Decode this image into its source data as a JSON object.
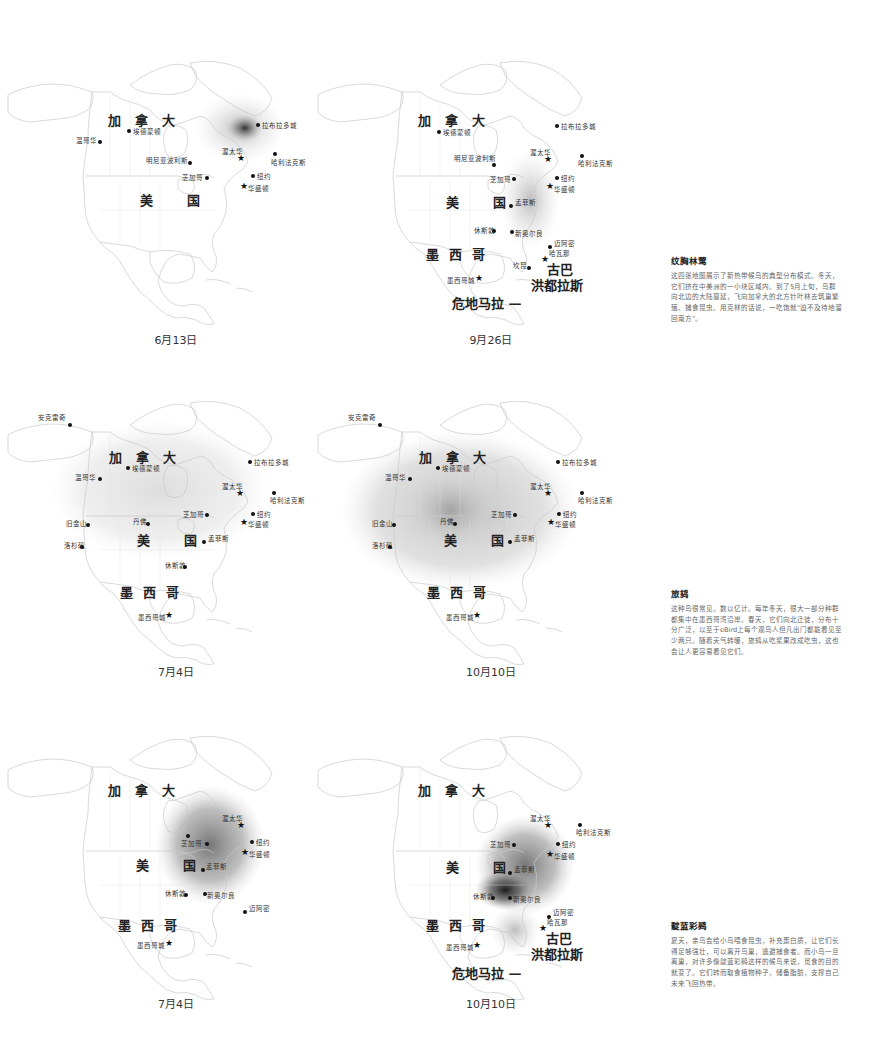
{
  "maps": [
    {
      "id": "map1",
      "date": "6月13日",
      "labels": {
        "canada": "加拿大",
        "usa": "美国"
      },
      "cities": [
        {
          "name": "拉布拉多城",
          "type": "dot"
        },
        {
          "name": "埃德蒙顿",
          "type": "dot"
        },
        {
          "name": "温哥华",
          "type": "dot"
        },
        {
          "name": "渥太华",
          "type": "star"
        },
        {
          "name": "哈利法克斯",
          "type": "dot"
        },
        {
          "name": "明尼亚波利斯",
          "type": "dot"
        },
        {
          "name": "芝加哥",
          "type": "dot"
        },
        {
          "name": "纽约",
          "type": "dot"
        },
        {
          "name": "华盛顿",
          "type": "star"
        }
      ]
    },
    {
      "id": "map2",
      "date": "9月26日",
      "labels": {
        "canada": "加拿大",
        "usa": "美国",
        "mexico": "墨西哥",
        "cuba": "古巴",
        "honduras": "洪都拉斯",
        "guatemala": "危地马拉 —"
      },
      "cities": [
        {
          "name": "拉布拉多城",
          "type": "dot"
        },
        {
          "name": "埃德蒙顿",
          "type": "dot"
        },
        {
          "name": "渥太华",
          "type": "star"
        },
        {
          "name": "明尼亚波利斯",
          "type": "dot"
        },
        {
          "name": "哈利法克斯",
          "type": "dot"
        },
        {
          "name": "芝加哥",
          "type": "dot"
        },
        {
          "name": "纽约",
          "type": "dot"
        },
        {
          "name": "华盛顿",
          "type": "star"
        },
        {
          "name": "孟菲斯",
          "type": "dot"
        },
        {
          "name": "休斯敦",
          "type": "dot"
        },
        {
          "name": "新奥尔良",
          "type": "dot"
        },
        {
          "name": "迈阿密",
          "type": "dot"
        },
        {
          "name": "哈瓦那",
          "type": "star"
        },
        {
          "name": "坎昆",
          "type": "dot"
        },
        {
          "name": "墨西哥城",
          "type": "star"
        }
      ]
    },
    {
      "id": "map3",
      "date": "7月4日",
      "labels": {
        "canada": "加拿大",
        "usa": "美国",
        "mexico": "墨西哥"
      },
      "cities": [
        {
          "name": "安克雷奇",
          "type": "dot"
        },
        {
          "name": "拉布拉多城",
          "type": "dot"
        },
        {
          "name": "埃德蒙顿",
          "type": "dot"
        },
        {
          "name": "温哥华",
          "type": "dot"
        },
        {
          "name": "渥太华",
          "type": "star"
        },
        {
          "name": "哈利法克斯",
          "type": "dot"
        },
        {
          "name": "芝加哥",
          "type": "dot"
        },
        {
          "name": "纽约",
          "type": "dot"
        },
        {
          "name": "旧金山",
          "type": "dot"
        },
        {
          "name": "丹佛",
          "type": "dot"
        },
        {
          "name": "华盛顿",
          "type": "star"
        },
        {
          "name": "孟菲斯",
          "type": "dot"
        },
        {
          "name": "洛杉矶",
          "type": "dot"
        },
        {
          "name": "休斯敦",
          "type": "dot"
        },
        {
          "name": "墨西哥城",
          "type": "star"
        }
      ]
    },
    {
      "id": "map4",
      "date": "10月10日",
      "labels": {
        "canada": "加拿大",
        "usa": "美国",
        "mexico": "墨西哥"
      },
      "cities": [
        {
          "name": "安克雷奇",
          "type": "dot"
        },
        {
          "name": "拉布拉多城",
          "type": "dot"
        },
        {
          "name": "埃德蒙顿",
          "type": "dot"
        },
        {
          "name": "温哥华",
          "type": "dot"
        },
        {
          "name": "渥太华",
          "type": "star"
        },
        {
          "name": "哈利法克斯",
          "type": "dot"
        },
        {
          "name": "芝加哥",
          "type": "dot"
        },
        {
          "name": "纽约",
          "type": "dot"
        },
        {
          "name": "旧金山",
          "type": "dot"
        },
        {
          "name": "丹佛",
          "type": "dot"
        },
        {
          "name": "华盛顿",
          "type": "star"
        },
        {
          "name": "孟菲斯",
          "type": "dot"
        },
        {
          "name": "洛杉矶",
          "type": "dot"
        },
        {
          "name": "墨西哥城",
          "type": "star"
        }
      ]
    },
    {
      "id": "map5",
      "date": "7月4日",
      "labels": {
        "canada": "加拿大",
        "usa": "美国",
        "mexico": "墨西哥"
      },
      "cities": [
        {
          "name": "渥太华",
          "type": "star"
        },
        {
          "name": "芝加哥",
          "type": "dot"
        },
        {
          "name": "纽约",
          "type": "dot"
        },
        {
          "name": "华盛顿",
          "type": "star"
        },
        {
          "name": "孟菲斯",
          "type": "dot"
        },
        {
          "name": "休斯敦",
          "type": "dot"
        },
        {
          "name": "新奥尔良",
          "type": "dot"
        },
        {
          "name": "迈阿密",
          "type": "dot"
        },
        {
          "name": "墨西哥城",
          "type": "star"
        }
      ]
    },
    {
      "id": "map6",
      "date": "10月10日",
      "labels": {
        "canada": "加拿大",
        "usa": "美国",
        "mexico": "墨西哥",
        "cuba": "古巴",
        "honduras": "洪都拉斯",
        "guatemala": "危地马拉 —"
      },
      "cities": [
        {
          "name": "渥太华",
          "type": "star"
        },
        {
          "name": "哈利法克斯",
          "type": "dot"
        },
        {
          "name": "芝加哥",
          "type": "dot"
        },
        {
          "name": "纽约",
          "type": "dot"
        },
        {
          "name": "华盛顿",
          "type": "star"
        },
        {
          "name": "孟菲斯",
          "type": "dot"
        },
        {
          "name": "休斯敦",
          "type": "dot"
        },
        {
          "name": "新奥尔良",
          "type": "dot"
        },
        {
          "name": "迈阿密",
          "type": "dot"
        },
        {
          "name": "哈瓦那",
          "type": "star"
        },
        {
          "name": "墨西哥城",
          "type": "star"
        }
      ]
    }
  ],
  "panels": [
    {
      "title": "纹胸林莺",
      "text": "这四张地图展示了新热带候鸟的典型分布模式。冬天，它们挤在中美洲的一小块区域内。到了5月上旬，鸟群向北边的大陆蔓延，飞向加拿大的北方针叶林去筑巢繁殖、捕食昆虫。用克林的话说，一吃饱就“迫不及待地溜回南方”。"
    },
    {
      "title": "旅鸫",
      "text": "这种鸟很常见，数以亿计。每年冬天，很大一部分种群都集中在墨西哥湾沿岸。春天，它们向北迁徙，分布十分广泛，以至于eBird上每个观鸟人但凡出门都能看见至少两只。随着天气转暖，旅鸫从吃浆果改成吃虫，这也会让人更容易看见它们。"
    },
    {
      "title": "靛蓝彩鹀",
      "text": "夏天，亲鸟会给小鸟喂食昆虫，补充蛋白质，让它们长得足够强壮，可以离开鸟巢，逃避捕食者。而小鸟一旦离巢，对许多像靛蓝彩鹀这样的候鸟来说，觅食的目的就变了。它们转而取食植物种子，储备脂肪，支撑自己未来飞回热带。"
    }
  ]
}
